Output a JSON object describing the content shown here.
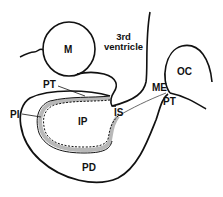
{
  "diagram": {
    "type": "anatomical-schematic",
    "labels": {
      "m": "M",
      "third_ventricle_line1": "3rd",
      "third_ventricle_line2": "ventricle",
      "oc": "OC",
      "pt_upper": "PT",
      "pi": "PI",
      "ip": "IP",
      "is": "IS",
      "me": "ME",
      "pt_right": "PT",
      "pd": "PD"
    },
    "colors": {
      "stroke": "#111111",
      "fill_band": "#b8b8b8",
      "background": "#ffffff"
    }
  }
}
